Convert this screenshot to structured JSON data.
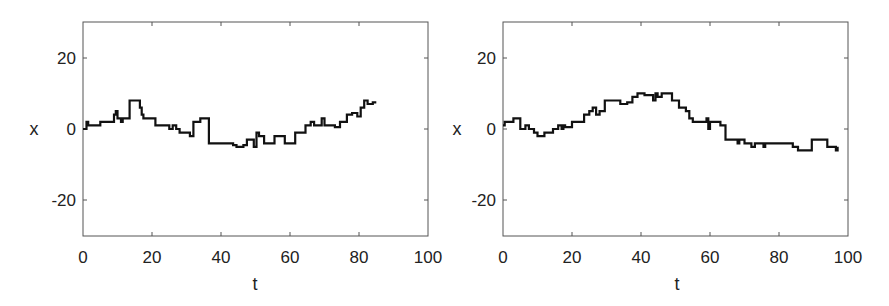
{
  "chart_data": [
    {
      "type": "line",
      "step": true,
      "title": "",
      "xlabel": "t",
      "ylabel": "x",
      "xlim": [
        0,
        100
      ],
      "ylim": [
        -30,
        30
      ],
      "xticks": [
        0,
        20,
        40,
        60,
        80,
        100
      ],
      "yticks": [
        -20,
        0,
        20
      ],
      "xtick_labels": [
        "0",
        "20",
        "40",
        "60",
        "80",
        "100"
      ],
      "ytick_labels": [
        "-20",
        "0",
        "20"
      ],
      "grid": false,
      "legend": null,
      "series": [
        {
          "name": "trajectory",
          "color": "#111111",
          "t": [
            0,
            1,
            1.5,
            5,
            9,
            9.5,
            10,
            11,
            11.5,
            13.5,
            16.5,
            17,
            17.5,
            21,
            25,
            26,
            27,
            28,
            31,
            32,
            34,
            36.5,
            43.5,
            44.5,
            46.5,
            47.5,
            49.5,
            50.3,
            51,
            52.5,
            55.5,
            58.5,
            61.5,
            64.5,
            66,
            67,
            69.2,
            70,
            73,
            74.5,
            76.5,
            78,
            79.5,
            80.5,
            81.5,
            82.5,
            84,
            85
          ],
          "x": [
            0,
            2,
            1,
            2,
            4,
            5,
            3,
            2,
            3,
            8,
            6,
            4,
            3,
            1,
            0,
            1,
            0,
            -1,
            -2,
            2,
            3,
            -4,
            -4.5,
            -5,
            -4.5,
            -3,
            -5,
            -1,
            -2,
            -4,
            -2,
            -4,
            -1,
            1,
            2,
            1,
            3,
            1,
            0.5,
            2,
            4,
            4.5,
            3.5,
            6,
            8,
            7,
            7.5,
            7.5
          ]
        }
      ]
    },
    {
      "type": "line",
      "step": true,
      "title": "",
      "xlabel": "t",
      "ylabel": "x",
      "xlim": [
        0,
        100
      ],
      "ylim": [
        -30,
        30
      ],
      "xticks": [
        0,
        20,
        40,
        60,
        80,
        100
      ],
      "yticks": [
        -20,
        0,
        20
      ],
      "xtick_labels": [
        "0",
        "20",
        "40",
        "60",
        "80",
        "100"
      ],
      "ytick_labels": [
        "-20",
        "0",
        "20"
      ],
      "grid": false,
      "legend": null,
      "series": [
        {
          "name": "trajectory",
          "color": "#111111",
          "t": [
            0,
            0.5,
            3,
            5,
            6.5,
            7.5,
            9,
            10,
            12,
            14.5,
            16,
            17,
            17.5,
            18,
            20,
            23.5,
            25,
            26,
            27,
            28,
            29.5,
            34,
            36,
            37.5,
            39,
            41,
            43.5,
            44.2,
            44.8,
            46,
            49,
            51,
            53,
            54,
            55,
            58.5,
            59,
            59.5,
            60,
            63,
            64.5,
            68,
            68.5,
            70,
            71,
            72,
            73,
            75.5,
            76,
            84,
            85.5,
            89.5,
            94,
            96.5,
            97
          ],
          "x": [
            1,
            2,
            3,
            0,
            1,
            0,
            -1,
            -2,
            -1,
            0,
            1,
            0,
            1,
            0.5,
            2,
            4,
            5,
            6,
            4,
            5,
            8,
            7,
            7.5,
            9,
            10,
            9.5,
            8,
            10,
            9,
            10,
            8,
            6,
            5,
            3,
            2,
            2,
            3,
            0,
            2,
            1,
            -3,
            -4,
            -3,
            -4,
            -4,
            -5,
            -4,
            -5,
            -4,
            -5,
            -6,
            -3,
            -5,
            -6,
            -5
          ]
        }
      ]
    }
  ],
  "panels": [
    {
      "xlabel": "t",
      "ylabel": "x",
      "xtick_labels": [
        "0",
        "20",
        "40",
        "60",
        "80",
        "100"
      ],
      "ytick_labels": [
        "20",
        "0",
        "-20"
      ]
    },
    {
      "xlabel": "t",
      "ylabel": "x",
      "xtick_labels": [
        "0",
        "20",
        "40",
        "60",
        "80",
        "100"
      ],
      "ytick_labels": [
        "20",
        "0",
        "-20"
      ]
    }
  ]
}
